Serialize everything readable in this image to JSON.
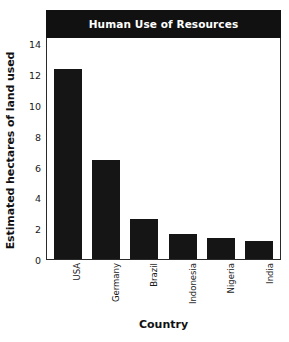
{
  "chart_data": {
    "type": "bar",
    "title": "Human Use of Resources",
    "xlabel": "Country",
    "ylabel": "Estimated hectares of land used",
    "categories": [
      "USA",
      "Germany",
      "Brazil",
      "Indonesia",
      "Nigeria",
      "India"
    ],
    "values": [
      12.3,
      6.4,
      2.6,
      1.6,
      1.35,
      1.2
    ],
    "ylim": [
      0,
      14.4
    ],
    "yticks": [
      0,
      2,
      4,
      6,
      8,
      10,
      12,
      14
    ],
    "ytick_labels": [
      "0",
      "2",
      "4",
      "6",
      "8",
      "10",
      "12",
      "14"
    ],
    "grid": false,
    "legend": "none",
    "bar_color": "#151515",
    "title_bar_color": "#111111",
    "title_text_color": "#ffffff",
    "axis_color": "#2a2a2a",
    "background_color": "#ffffff"
  }
}
